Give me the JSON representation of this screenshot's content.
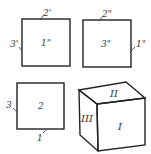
{
  "diagram": {
    "type": "cube-net-views",
    "top_left_square": {
      "face_label": "1\"",
      "top_edge_label": "2'",
      "left_edge_label": "3'"
    },
    "top_right_square": {
      "face_label": "3\"",
      "top_edge_label": "2\"",
      "right_edge_label": "1\""
    },
    "bottom_left_square": {
      "face_label": "2",
      "left_edge_label": "3",
      "bottom_edge_label": "1"
    },
    "cube": {
      "front_face_label": "I",
      "top_face_label": "II",
      "left_face_label": "III"
    },
    "stroke_color": "#222222",
    "background_color": "#ffffff"
  }
}
